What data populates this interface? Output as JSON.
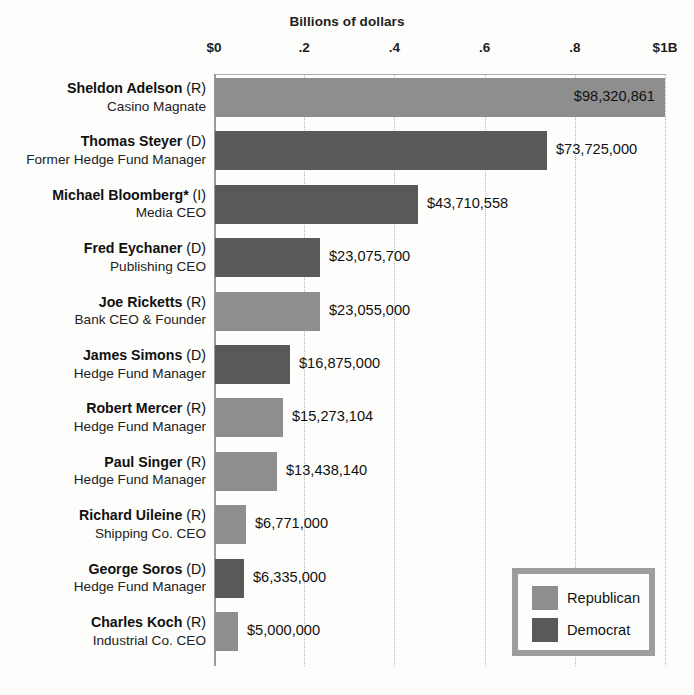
{
  "chart_data": {
    "type": "bar",
    "title": "Billions of dollars",
    "xlabel": "Billions of dollars",
    "ylabel": "",
    "orientation": "horizontal",
    "xlim": [
      0,
      1000000000
    ],
    "grid": true,
    "tick_labels": [
      "$0",
      ".2",
      ".4",
      ".6",
      ".8",
      "$1B"
    ],
    "tick_values": [
      0,
      200000000,
      400000000,
      600000000,
      800000000,
      1000000000
    ],
    "legend_position": "bottom-right",
    "legend": [
      {
        "label": "Republican",
        "color": "#8e8e8e"
      },
      {
        "label": "Democrat",
        "color": "#595959"
      }
    ],
    "categories": [
      "Sheldon Adelson",
      "Thomas Steyer",
      "Michael Bloomberg*",
      "Fred Eychaner",
      "Joe Ricketts",
      "James Simons",
      "Robert Mercer",
      "Paul Singer",
      "Richard Uileine",
      "George Soros",
      "Charles Koch"
    ],
    "values": [
      98320861,
      73725000,
      43710558,
      23075700,
      23055000,
      16875000,
      15273104,
      13438140,
      6771000,
      6335000,
      5000000
    ],
    "value_labels": [
      "$98,320,861",
      "$73,725,000",
      "$43,710,558",
      "$23,075,700",
      "$23,055,000",
      "$16,875,000",
      "$15,273,104",
      "$13,438,140",
      "$6,771,000",
      "$6,335,000",
      "$5,000,000"
    ],
    "rows": [
      {
        "name": "Sheldon Adelson",
        "party": "(R)",
        "occupation": "Casino Magnate",
        "value": 98320861,
        "value_label": "$98,320,861",
        "group": "rep",
        "bar_px": 450,
        "label_inside": true
      },
      {
        "name": "Thomas Steyer",
        "party": "(D)",
        "occupation": "Former Hedge Fund Manager",
        "value": 73725000,
        "value_label": "$73,725,000",
        "group": "dem",
        "bar_px": 332,
        "label_inside": false
      },
      {
        "name": "Michael Bloomberg*",
        "party": "(I)",
        "occupation": "Media CEO",
        "value": 43710558,
        "value_label": "$43,710,558",
        "group": "ind",
        "bar_px": 203,
        "label_inside": false
      },
      {
        "name": "Fred Eychaner",
        "party": "(D)",
        "occupation": "Publishing CEO",
        "value": 23075700,
        "value_label": "$23,075,700",
        "group": "dem",
        "bar_px": 105,
        "label_inside": false
      },
      {
        "name": "Joe Ricketts",
        "party": "(R)",
        "occupation": "Bank CEO & Founder",
        "value": 23055000,
        "value_label": "$23,055,000",
        "group": "rep",
        "bar_px": 105,
        "label_inside": false
      },
      {
        "name": "James Simons",
        "party": "(D)",
        "occupation": "Hedge Fund Manager",
        "value": 16875000,
        "value_label": "$16,875,000",
        "group": "dem",
        "bar_px": 75,
        "label_inside": false
      },
      {
        "name": "Robert Mercer",
        "party": "(R)",
        "occupation": "Hedge Fund Manager",
        "value": 15273104,
        "value_label": "$15,273,104",
        "group": "rep",
        "bar_px": 68,
        "label_inside": false
      },
      {
        "name": "Paul Singer",
        "party": "(R)",
        "occupation": "Hedge Fund Manager",
        "value": 13438140,
        "value_label": "$13,438,140",
        "group": "rep",
        "bar_px": 62,
        "label_inside": false
      },
      {
        "name": "Richard Uileine",
        "party": "(R)",
        "occupation": "Shipping Co. CEO",
        "value": 6771000,
        "value_label": "$6,771,000",
        "group": "rep",
        "bar_px": 31,
        "label_inside": false
      },
      {
        "name": "George Soros",
        "party": "(D)",
        "occupation": "Hedge Fund Manager",
        "value": 6335000,
        "value_label": "$6,335,000",
        "group": "dem",
        "bar_px": 29,
        "label_inside": false
      },
      {
        "name": "Charles Koch",
        "party": "(R)",
        "occupation": "Industrial Co. CEO",
        "value": 5000000,
        "value_label": "$5,000,000",
        "group": "rep",
        "bar_px": 23,
        "label_inside": false
      }
    ]
  },
  "colors": {
    "republican": "#8e8e8e",
    "democrat": "#595959",
    "legend_border": "#9d9d9d",
    "gridline": "#b4b4b4",
    "axis": "#9a9a9a",
    "background": "#fdfdfb",
    "text": "#1d1d1d"
  }
}
